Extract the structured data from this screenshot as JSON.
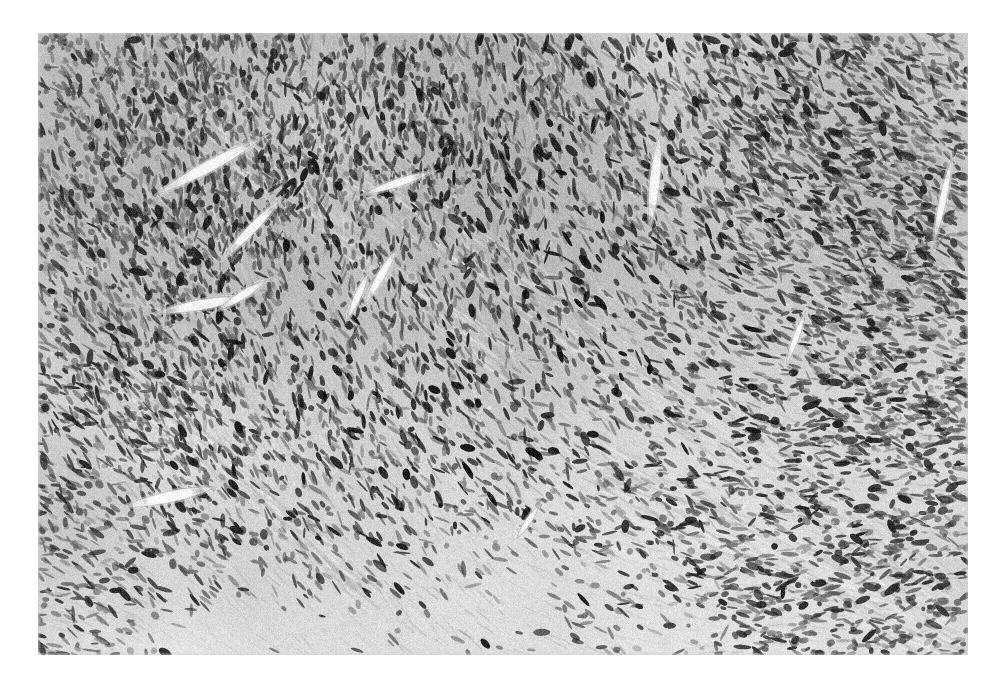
{
  "page": {
    "width": 998,
    "height": 684,
    "background_color": "#ffffff"
  },
  "figure": {
    "name": "histopathology-micrograph",
    "modality": "brightfield-light-microscopy",
    "stain": "hematoxylin-and-eosin",
    "rendering": "grayscale-halftone-print",
    "caption": "",
    "plate": {
      "x": 38,
      "y": 33,
      "width": 930,
      "height": 622,
      "border": "none",
      "background_color": "#cfcfcf"
    },
    "tone": {
      "paper_white": "#ffffff",
      "background_light": "#e4e4e4",
      "background_mid": "#c2c2c2",
      "background_dark": "#9a9a9a",
      "nucleus_dark": "#1a1a1a",
      "nucleus_mid": "#4a4a4a",
      "vessel_lumen": "#f4f4f4",
      "collagen_band": "#dcdcdc"
    },
    "content_description": {
      "tissue": "spindle cell neoplasm",
      "architecture": "interlacing fascicles",
      "cellularity": "high",
      "nuclei_shape": "elongated spindle to ovoid",
      "dominant_fascicle_direction_deg": 38,
      "regions": [
        {
          "name": "upper-left-dense-fascicles",
          "tone": "dark"
        },
        {
          "name": "upper-right-dense-cellular",
          "tone": "dark"
        },
        {
          "name": "central-diagonal-collagen-band",
          "tone": "light"
        },
        {
          "name": "lower-center-hypocellular",
          "tone": "light"
        },
        {
          "name": "lower-right-streaming-fascicles",
          "tone": "mid"
        }
      ]
    },
    "vessels": [
      {
        "name": "vessel-slit-upper-left",
        "cx": 172,
        "cy": 133,
        "len": 120,
        "thick": 11,
        "angle": 62
      },
      {
        "name": "vessel-slit-upper-left-2",
        "cx": 214,
        "cy": 196,
        "len": 86,
        "thick": 9,
        "angle": 44
      },
      {
        "name": "vessel-slit-left-mid",
        "cx": 163,
        "cy": 272,
        "len": 92,
        "thick": 10,
        "angle": 80
      },
      {
        "name": "vessel-slit-left-mid-2",
        "cx": 205,
        "cy": 262,
        "len": 56,
        "thick": 8,
        "angle": 58
      },
      {
        "name": "vessel-slit-left-lower",
        "cx": 132,
        "cy": 464,
        "len": 96,
        "thick": 11,
        "angle": 78
      },
      {
        "name": "vessel-slit-center-top",
        "cx": 360,
        "cy": 150,
        "len": 74,
        "thick": 8,
        "angle": 72
      },
      {
        "name": "vessel-slit-center",
        "cx": 343,
        "cy": 243,
        "len": 66,
        "thick": 8,
        "angle": 30
      },
      {
        "name": "vessel-slit-center-2",
        "cx": 320,
        "cy": 263,
        "len": 54,
        "thick": 7,
        "angle": 24
      },
      {
        "name": "vessel-slit-upper-right",
        "cx": 617,
        "cy": 148,
        "len": 96,
        "thick": 10,
        "angle": 6
      },
      {
        "name": "vessel-slit-right",
        "cx": 905,
        "cy": 167,
        "len": 86,
        "thick": 7,
        "angle": 12
      },
      {
        "name": "vessel-slit-right-2",
        "cx": 758,
        "cy": 305,
        "len": 58,
        "thick": 6,
        "angle": 20
      },
      {
        "name": "vessel-slit-lower-center",
        "cx": 490,
        "cy": 489,
        "len": 40,
        "thick": 6,
        "angle": 34
      },
      {
        "name": "vessel-slit-far-right",
        "cx": 943,
        "cy": 454,
        "len": 44,
        "thick": 6,
        "angle": 74
      }
    ],
    "bands": [
      {
        "name": "collagen-band-main",
        "x1": 300,
        "y1": 120,
        "x2": 900,
        "y2": 560,
        "width": 54,
        "tone": 0.26
      },
      {
        "name": "collagen-band-upper",
        "x1": 120,
        "y1": 60,
        "x2": 470,
        "y2": 330,
        "width": 34,
        "tone": 0.18
      },
      {
        "name": "collagen-band-lower",
        "x1": 560,
        "y1": 430,
        "x2": 960,
        "y2": 640,
        "width": 46,
        "tone": 0.22
      },
      {
        "name": "collagen-band-left",
        "x1": 70,
        "y1": 330,
        "x2": 330,
        "y2": 560,
        "width": 30,
        "tone": 0.14
      }
    ],
    "density_field": {
      "seed": 20240517,
      "nuclei_count": 14000,
      "blobs": [
        {
          "name": "dense-upper-left",
          "cx": 160,
          "cy": 110,
          "rx": 230,
          "ry": 170,
          "amp": 0.42
        },
        {
          "name": "dense-upper-mid",
          "cx": 430,
          "cy": 95,
          "rx": 200,
          "ry": 120,
          "amp": 0.3
        },
        {
          "name": "dense-upper-right",
          "cx": 820,
          "cy": 130,
          "rx": 260,
          "ry": 180,
          "amp": 0.4
        },
        {
          "name": "dense-right-mid",
          "cx": 880,
          "cy": 330,
          "rx": 190,
          "ry": 170,
          "amp": 0.3
        },
        {
          "name": "dense-left-mid",
          "cx": 95,
          "cy": 330,
          "rx": 150,
          "ry": 200,
          "amp": 0.3
        },
        {
          "name": "dense-lower-right",
          "cx": 800,
          "cy": 560,
          "rx": 230,
          "ry": 140,
          "amp": 0.24
        },
        {
          "name": "sparse-lower-mid",
          "cx": 460,
          "cy": 590,
          "rx": 300,
          "ry": 150,
          "amp": -0.34
        },
        {
          "name": "sparse-center",
          "cx": 560,
          "cy": 330,
          "rx": 200,
          "ry": 140,
          "amp": -0.18
        },
        {
          "name": "sparse-lower-left",
          "cx": 190,
          "cy": 600,
          "rx": 180,
          "ry": 110,
          "amp": -0.26
        }
      ]
    }
  }
}
